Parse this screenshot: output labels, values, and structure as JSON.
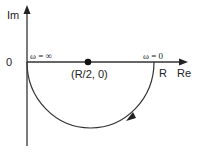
{
  "diagram": {
    "type": "nyquist-plot",
    "axes": {
      "y_label": "Im",
      "x_label": "Re",
      "origin_label": "0"
    },
    "points": {
      "center_label": "(R/2, 0)",
      "right_intercept_label": "R"
    },
    "annotations": {
      "omega_infinity": "ω = ∞",
      "omega_zero": "ω = 0"
    },
    "colors": {
      "line": "#333333",
      "background": "#ffffff"
    }
  }
}
